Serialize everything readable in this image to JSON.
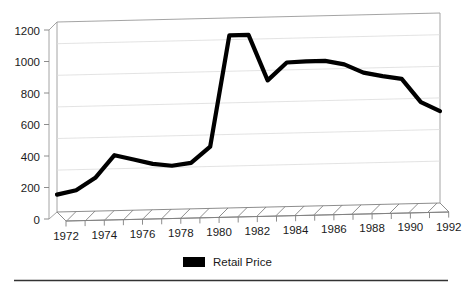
{
  "chart_data": {
    "type": "line",
    "title": "",
    "subtitle": "",
    "xlabel": "",
    "ylabel": "",
    "xlim": [
      1972,
      1992
    ],
    "ylim": [
      0,
      1200
    ],
    "ytick_step": 200,
    "xtick_step": 2,
    "grid": true,
    "grid_axis": "y",
    "style": "3d-perspective",
    "legend_position": "bottom-center",
    "yticks": [
      "0",
      "200",
      "400",
      "600",
      "800",
      "1000",
      "1200"
    ],
    "xticks": [
      "1972",
      "1974",
      "1976",
      "1978",
      "1980",
      "1982",
      "1984",
      "1986",
      "1988",
      "1990",
      "1992"
    ],
    "x": [
      1972,
      1973,
      1974,
      1975,
      1976,
      1977,
      1978,
      1979,
      1980,
      1981,
      1982,
      1983,
      1984,
      1985,
      1986,
      1987,
      1988,
      1989,
      1990,
      1991,
      1992
    ],
    "series": [
      {
        "name": "Retail Price",
        "color": "#000000",
        "values": [
          110,
          135,
          210,
          350,
          320,
          290,
          275,
          290,
          390,
          1090,
          1090,
          800,
          910,
          915,
          915,
          890,
          835,
          810,
          790,
          640,
          580
        ]
      }
    ],
    "legend": [
      {
        "label": "Retail Price",
        "color": "#000000",
        "swatch": "filled-rect"
      }
    ],
    "colors": {
      "series": "#000000",
      "grid": "#d9d9d9",
      "axis": "#808080",
      "frame": "#9a9a9a",
      "text": "#1a1a1a",
      "background": "#ffffff",
      "rule": "#333333"
    }
  },
  "footer": {
    "rule": "horizontal-rule"
  }
}
